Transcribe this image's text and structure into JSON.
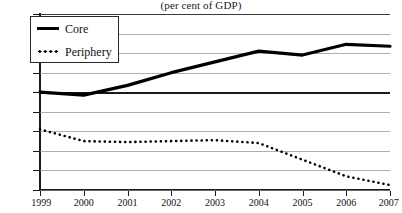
{
  "chart_data": {
    "type": "line",
    "title": "",
    "subtitle": "(per cent of GDP)",
    "xlabel": "",
    "ylabel": "",
    "x": [
      1999,
      2000,
      2001,
      2002,
      2003,
      2004,
      2005,
      2006,
      2007
    ],
    "xtick_labels": [
      "1999",
      "2000",
      "2001",
      "2002",
      "2003",
      "2004",
      "2005",
      "2006",
      "2007"
    ],
    "ytick_labels": [
      "8",
      "6",
      "4",
      "2",
      "0",
      "-2",
      "-4",
      "-6",
      "-8",
      "-10"
    ],
    "ytick_values": [
      8,
      6,
      4,
      2,
      0,
      -2,
      -4,
      -6,
      -8,
      -10
    ],
    "xlim": [
      1999,
      2007
    ],
    "ylim": [
      -10,
      8
    ],
    "grid": true,
    "legend_position": "top-left",
    "series": [
      {
        "name": "Core",
        "style": "solid",
        "color": "#000000",
        "values": [
          0.0,
          -0.3,
          0.7,
          2.0,
          3.1,
          4.2,
          3.8,
          4.9,
          4.7
        ]
      },
      {
        "name": "Periphery",
        "style": "dotted",
        "color": "#000000",
        "values": [
          -3.8,
          -5.0,
          -5.1,
          -5.0,
          -4.9,
          -5.2,
          -6.9,
          -8.6,
          -9.5
        ]
      }
    ]
  }
}
